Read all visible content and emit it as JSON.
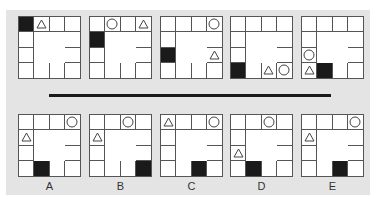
{
  "colors": {
    "panel_background": "#e4e4e4",
    "grid_line": "#555555",
    "black_cell": "#1a1a1a",
    "divider": "#1a1a1a"
  },
  "layout": {
    "grid_size": 4,
    "note": "4x4 perimeter grid; centre 2x2 merged"
  },
  "sequence": [
    {
      "index": 1,
      "black": [
        0,
        0
      ],
      "triangle": [
        0,
        1
      ],
      "circle": null
    },
    {
      "index": 2,
      "black": [
        1,
        0
      ],
      "triangle": [
        0,
        3
      ],
      "circle": [
        0,
        1
      ]
    },
    {
      "index": 3,
      "black": [
        2,
        0
      ],
      "triangle": [
        2,
        3
      ],
      "circle": [
        0,
        3
      ]
    },
    {
      "index": 4,
      "black": [
        3,
        0
      ],
      "triangle": [
        3,
        2
      ],
      "circle": [
        3,
        3
      ]
    },
    {
      "index": 5,
      "black": [
        3,
        1
      ],
      "triangle": [
        3,
        0
      ],
      "circle": [
        2,
        0
      ]
    }
  ],
  "options": [
    {
      "label": "A",
      "black": [
        3,
        1
      ],
      "triangle": [
        1,
        0
      ],
      "circle": [
        0,
        3
      ]
    },
    {
      "label": "B",
      "black": [
        3,
        3
      ],
      "triangle": [
        1,
        0
      ],
      "circle": [
        0,
        2
      ]
    },
    {
      "label": "C",
      "black": [
        3,
        2
      ],
      "triangle": [
        0,
        0
      ],
      "circle": [
        0,
        3
      ]
    },
    {
      "label": "D",
      "black": [
        3,
        1
      ],
      "triangle": [
        2,
        0
      ],
      "circle": [
        0,
        2
      ]
    },
    {
      "label": "E",
      "black": [
        3,
        2
      ],
      "triangle": [
        1,
        0
      ],
      "circle": [
        0,
        3
      ]
    }
  ]
}
